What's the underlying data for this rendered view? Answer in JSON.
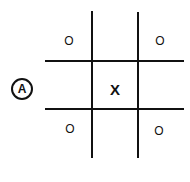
{
  "label": "A",
  "board": {
    "cells": [
      [
        "O",
        "",
        "O"
      ],
      [
        "",
        "X",
        ""
      ],
      [
        "O",
        "",
        "O"
      ]
    ]
  },
  "marks": {
    "top_left": "O",
    "top_right": "O",
    "center": "X",
    "bottom_left": "O",
    "bottom_right": "O"
  }
}
